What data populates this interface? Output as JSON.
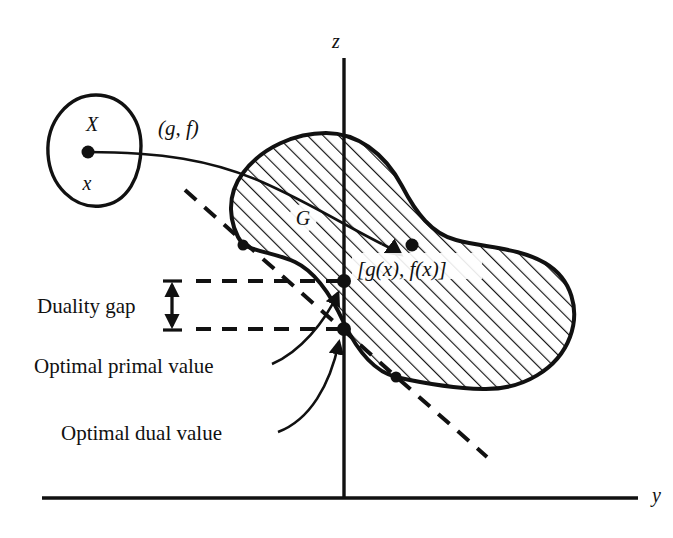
{
  "figure": {
    "type": "math-diagram",
    "background_color": "#ffffff",
    "stroke_color": "#111111"
  },
  "axes": {
    "vertical": {
      "label": "z",
      "label_x": 336,
      "label_y": 48,
      "x": 344,
      "y_top": 58,
      "y_bottom": 498
    },
    "horizontal": {
      "label": "y",
      "label_x": 652,
      "label_y": 502,
      "y": 498,
      "x_left": 42,
      "x_right": 638
    }
  },
  "sets": {
    "domain_set": {
      "label": "X",
      "label_x": 92,
      "label_y": 124,
      "point_label": "x",
      "point_label_x": 87,
      "point_label_y": 182,
      "point_x": 88,
      "point_y": 152
    },
    "image_set": {
      "label": "G",
      "label_x": 303,
      "label_y": 225,
      "hatched": true,
      "hatch_angle_deg": 45
    }
  },
  "mappings": {
    "map_label": "(g, f)",
    "map_label_x": 158,
    "map_label_y": 135,
    "image_point_label": "[g(x), f(x)]",
    "image_point_label_x": 357,
    "image_point_label_y": 276,
    "image_point_x": 412,
    "image_point_y": 245
  },
  "annotations": [
    {
      "name": "duality-gap",
      "label": "Duality gap",
      "label_x": 37,
      "label_y": 313,
      "bracket_x": 172,
      "bracket_top_y": 282,
      "bracket_bottom_y": 330
    },
    {
      "name": "optimal-primal-value",
      "label": "Optimal primal value",
      "label_x": 34,
      "label_y": 373,
      "leader_from_x": 272,
      "leader_from_y": 362,
      "leader_to_x": 339,
      "leader_to_y": 291
    },
    {
      "name": "optimal-dual-value",
      "label": "Optimal dual value",
      "label_x": 61,
      "label_y": 440,
      "leader_from_x": 278,
      "leader_from_y": 430,
      "leader_to_x": 341,
      "leader_to_y": 339
    }
  ],
  "points": [
    {
      "name": "x-point",
      "x": 88,
      "y": 152,
      "r": 6
    },
    {
      "name": "upper-tangency-point",
      "x": 243,
      "y": 245,
      "r": 5.5
    },
    {
      "name": "optimal-primal-point",
      "x": 344,
      "y": 281,
      "r": 6.5
    },
    {
      "name": "optimal-dual-point",
      "x": 344,
      "y": 328,
      "r": 6.5
    },
    {
      "name": "lower-tangency-point",
      "x": 396,
      "y": 377,
      "r": 5.5
    },
    {
      "name": "image-point",
      "x": 412,
      "y": 245,
      "r": 6
    }
  ],
  "dashed_lines": {
    "hyperplane": {
      "x1": 185,
      "y1": 190,
      "x2": 487,
      "y2": 457
    },
    "primal_level": {
      "x1": 196,
      "y1": 281,
      "x2": 344,
      "y2": 281
    },
    "dual_level": {
      "x1": 196,
      "y1": 329,
      "x2": 344,
      "y2": 329
    }
  },
  "colors": {
    "ink": "#111111",
    "paper": "#ffffff"
  }
}
